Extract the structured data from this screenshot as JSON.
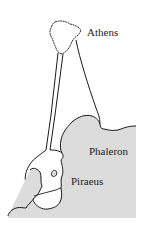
{
  "map": {
    "labels": {
      "athens": "Athens",
      "phaleron": "Phaleron",
      "piraeus": "Piraeus"
    },
    "colors": {
      "sea": "#dcdcdc",
      "land": "#ffffff",
      "line": "#1a1a1a"
    }
  }
}
